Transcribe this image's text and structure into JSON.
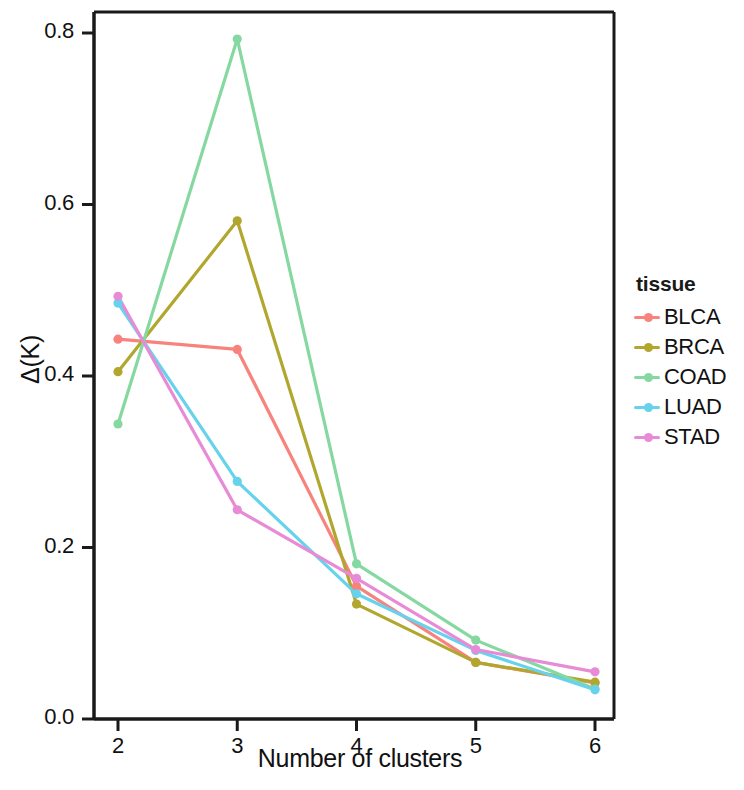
{
  "chart_data": {
    "type": "line",
    "title": "",
    "subtitle": "",
    "xlabel": "Number of clusters",
    "ylabel": "Δ(K)",
    "x": [
      2,
      3,
      4,
      5,
      6
    ],
    "xtick_labels": [
      "2",
      "3",
      "4",
      "5",
      "6"
    ],
    "ytick_labels": [
      "0.0",
      "0.2",
      "0.4",
      "0.6",
      "0.8"
    ],
    "ytick_values": [
      0.0,
      0.2,
      0.4,
      0.6,
      0.8
    ],
    "xlim": [
      1.8,
      6.2
    ],
    "ylim": [
      0.0,
      0.83
    ],
    "grid": false,
    "legend_title": "tissue",
    "legend_position": "right",
    "markers": "circle",
    "series": [
      {
        "name": "BLCA",
        "color": "#F8837C",
        "values": [
          0.443,
          0.431,
          0.155,
          0.066,
          0.042
        ]
      },
      {
        "name": "BRCA",
        "color": "#B2A72E",
        "values": [
          0.405,
          0.581,
          0.134,
          0.066,
          0.043
        ]
      },
      {
        "name": "COAD",
        "color": "#85D9A0",
        "values": [
          0.344,
          0.793,
          0.181,
          0.092,
          0.035
        ]
      },
      {
        "name": "LUAD",
        "color": "#67D2EC",
        "values": [
          0.485,
          0.277,
          0.146,
          0.08,
          0.034
        ]
      },
      {
        "name": "STAD",
        "color": "#E78BD6",
        "values": [
          0.493,
          0.244,
          0.164,
          0.081,
          0.055
        ]
      }
    ]
  },
  "legend": {
    "title": "tissue",
    "items": [
      {
        "label": "BLCA",
        "color": "#F8837C"
      },
      {
        "label": "BRCA",
        "color": "#B2A72E"
      },
      {
        "label": "COAD",
        "color": "#85D9A0"
      },
      {
        "label": "LUAD",
        "color": "#67D2EC"
      },
      {
        "label": "STAD",
        "color": "#E78BD6"
      }
    ]
  },
  "axes": {
    "x_title": "Number of clusters",
    "y_title": "Δ(K)",
    "x_ticks": [
      "2",
      "3",
      "4",
      "5",
      "6"
    ],
    "y_ticks": [
      "0.8",
      "0.6",
      "0.4",
      "0.2",
      "0.0"
    ]
  },
  "style": {
    "axis_color": "#1a1a1a",
    "background": "#ffffff",
    "text_color": "#111111"
  }
}
